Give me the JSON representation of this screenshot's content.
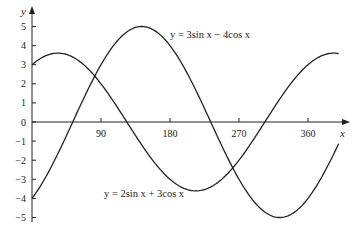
{
  "chart_data": {
    "type": "line",
    "title": "",
    "xlabel": "x",
    "ylabel": "y",
    "xlim": [
      0,
      400
    ],
    "ylim": [
      -5,
      5
    ],
    "grid": false,
    "x_ticks": [
      90,
      180,
      270,
      360
    ],
    "x_tick_labels": [
      "90",
      "180",
      "270",
      "360"
    ],
    "y_ticks": [
      -5,
      -4,
      -3,
      -2,
      -1,
      0,
      1,
      2,
      3,
      4,
      5
    ],
    "y_tick_labels": [
      "−5",
      "−4",
      "−3",
      "−2",
      "−1",
      "0",
      "1",
      "2",
      "3",
      "4",
      "5"
    ],
    "series": [
      {
        "name": "y = 3sin x − 4cos x",
        "a": 3,
        "b": -4,
        "x_range": [
          0,
          400
        ],
        "color": "#222222"
      },
      {
        "name": "y = 2sin x + 3cos x",
        "a": 2,
        "b": 3,
        "x_range": [
          0,
          400
        ],
        "color": "#222222"
      }
    ],
    "annotations": [
      {
        "text": "y = 3sin x − 4cos x",
        "series": 0
      },
      {
        "text": "y = 2sin x + 3cos x",
        "series": 1
      }
    ]
  }
}
